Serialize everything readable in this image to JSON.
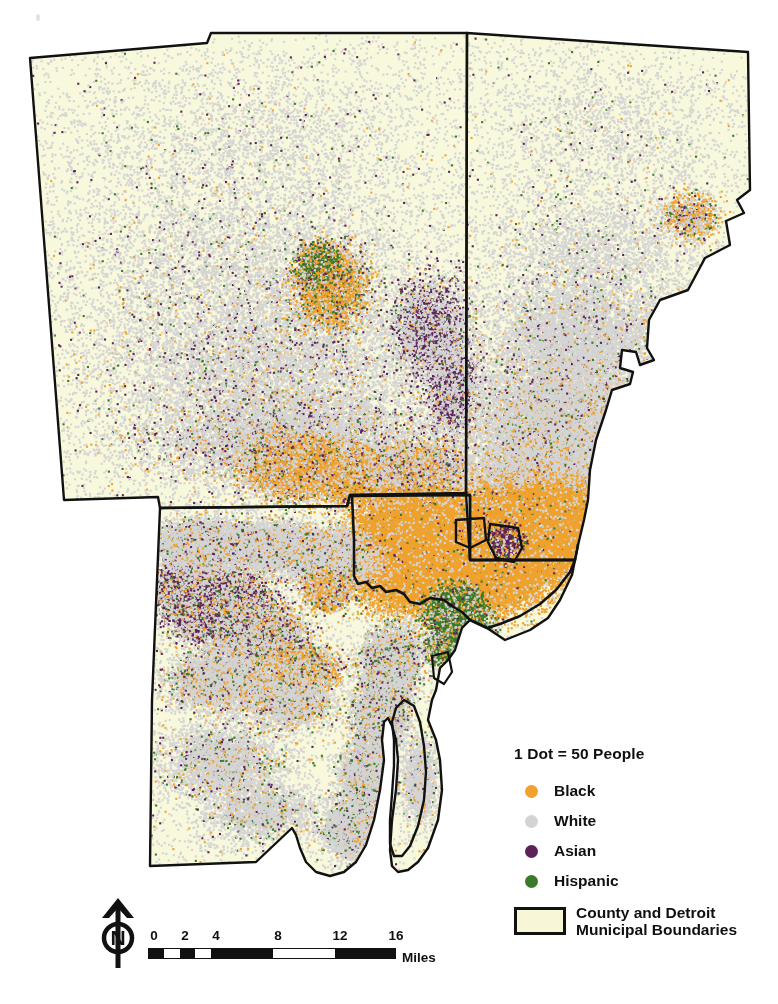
{
  "map": {
    "title": "Metro Detroit Racial Dot Density Map",
    "background_color": "#ffffff",
    "land_fill_color": "#f8f8dc",
    "boundary_stroke_color": "#111111"
  },
  "legend": {
    "title": "1 Dot = 50 People",
    "entries": [
      {
        "label": "Black",
        "color": "#efa22e",
        "icon": "dot-icon"
      },
      {
        "label": "White",
        "color": "#d4d4d4",
        "icon": "dot-icon"
      },
      {
        "label": "Asian",
        "color": "#5b2259",
        "icon": "dot-icon"
      },
      {
        "label": "Hispanic",
        "color": "#3a7a2b",
        "icon": "dot-icon"
      }
    ],
    "boundary": {
      "label_line1": "County and Detroit",
      "label_line2": "Municipal Boundaries",
      "fill_color": "#f7f7d7",
      "stroke_color": "#111111"
    }
  },
  "north_arrow": {
    "letter": "N",
    "icon": "north-arrow-icon"
  },
  "scale_bar": {
    "units": "Miles",
    "ticks": [
      "0",
      "2",
      "4",
      "8",
      "12",
      "16"
    ],
    "tick_values": [
      0,
      2,
      4,
      8,
      12,
      16
    ],
    "max_value": 16
  },
  "chart_data": {
    "type": "map",
    "dot_value": 50,
    "dot_unit": "People",
    "categories": [
      "Black",
      "White",
      "Asian",
      "Hispanic"
    ],
    "colors": [
      "#efa22e",
      "#d4d4d4",
      "#5b2259",
      "#3a7a2b"
    ],
    "regions": [
      {
        "name": "Oakland County",
        "dominant": "White"
      },
      {
        "name": "Macomb County",
        "dominant": "White"
      },
      {
        "name": "Wayne County",
        "dominant": "White"
      },
      {
        "name": "Detroit",
        "dominant": "Black"
      },
      {
        "name": "Highland Park",
        "dominant": "Black"
      },
      {
        "name": "Hamtramck",
        "dominant": "Asian"
      },
      {
        "name": "Southwest Detroit",
        "dominant": "Hispanic"
      },
      {
        "name": "Pontiac",
        "dominant": "Black"
      },
      {
        "name": "Dearborn",
        "dominant": "Asian"
      }
    ],
    "legend_position": "bottom-right",
    "grid": false
  }
}
